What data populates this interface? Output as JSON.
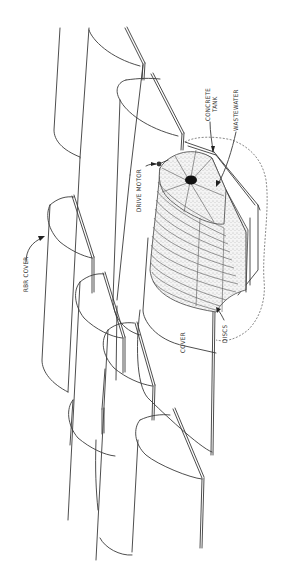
{
  "figure": {
    "type": "technical-line-drawing",
    "orientation": "rotated 90 degrees (labels read bottom-to-top)",
    "background": "#ffffff",
    "line_color": "#3a3a3a"
  },
  "labels": {
    "concrete_tank_line1": "CONCRETE",
    "concrete_tank_line2": "TANK",
    "wastewater": "WASTEWATER",
    "drive_motor": "DRIVE MOTOR",
    "rbr_cover": "RBR COVER",
    "cover": "COVER",
    "discs": "DISCS"
  },
  "components": [
    {
      "name": "RBR cover units",
      "count": 6,
      "shape": "half-cylinder shells in staggered rows"
    },
    {
      "name": "Disc assembly",
      "shape": "stack of stippled discs on shaft"
    },
    {
      "name": "Concrete tank",
      "shape": "octagonal-profile trough, dashed outline"
    },
    {
      "name": "Drive motor",
      "shape": "small motor at shaft end"
    }
  ]
}
